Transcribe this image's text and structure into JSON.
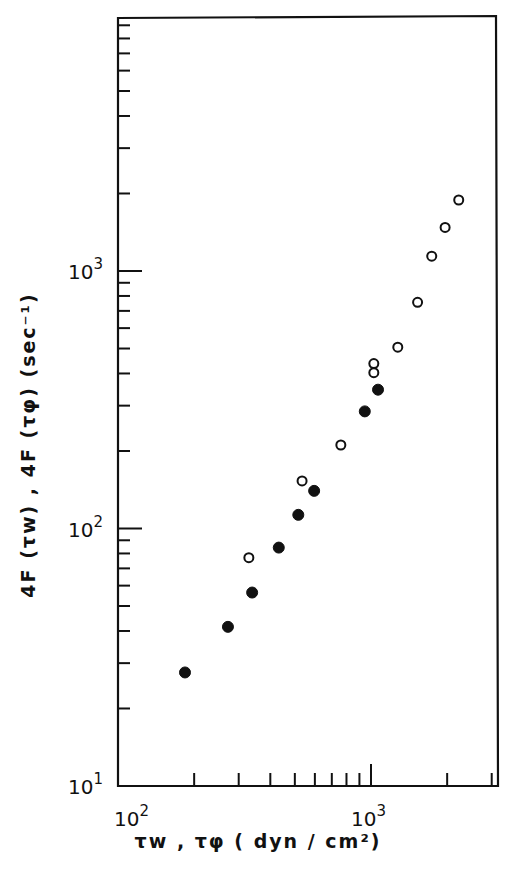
{
  "chart_data": {
    "type": "scatter",
    "title": "",
    "xlabel": "τw , τφ ( dyn / cm²)",
    "ylabel": "4F (τw) , 4F (τφ) (sec⁻¹)",
    "xscale": "log",
    "yscale": "log",
    "xlim": [
      100,
      3500
    ],
    "ylim": [
      10,
      8000
    ],
    "x_tick_labels": [
      "10²",
      "10³"
    ],
    "y_tick_labels": [
      "10¹",
      "10²",
      "10³"
    ],
    "grid": false,
    "legend": null,
    "series": [
      {
        "name": "4F(τw) vs τw",
        "marker": "filled-circle",
        "x": [
          184,
          272,
          339,
          432,
          516,
          596,
          945,
          1066
        ],
        "y": [
          27.6,
          41.5,
          56.4,
          84.3,
          113,
          140,
          285,
          346
        ]
      },
      {
        "name": "4F(τφ) vs τφ",
        "marker": "open-circle",
        "x": [
          329,
          534,
          760,
          1026,
          1026,
          1276,
          1528,
          1738,
          1963,
          2222
        ],
        "y": [
          77,
          153,
          211,
          403,
          437,
          506,
          756,
          1142,
          1477,
          1887
        ]
      }
    ]
  },
  "labels": {
    "x_axis": "τw , τφ ( dyn / cm²)",
    "y_axis": "4F (τw) , 4F (τφ) (sec⁻¹)",
    "x_tick_100": "10",
    "x_tick_100_exp": "2",
    "x_tick_1000": "10",
    "x_tick_1000_exp": "3",
    "y_tick_10": "10",
    "y_tick_10_exp": "1",
    "y_tick_100": "10",
    "y_tick_100_exp": "2",
    "y_tick_1000": "10",
    "y_tick_1000_exp": "3"
  }
}
